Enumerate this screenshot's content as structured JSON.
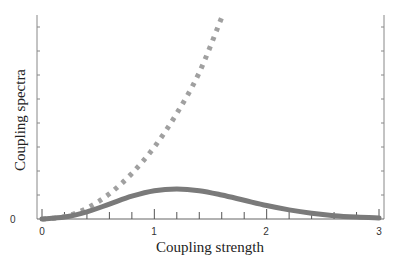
{
  "chart_data": {
    "type": "line",
    "title": "",
    "xlabel": "Coupling strength",
    "ylabel": "Coupling spectra",
    "xlim": [
      0,
      3
    ],
    "ylim": [
      0,
      8.5
    ],
    "x_ticks": [
      "0",
      "1",
      "2",
      "3"
    ],
    "y_ticks": [
      "0"
    ],
    "grid": false,
    "legend": null,
    "series": [
      {
        "name": "dotted",
        "style": "dotted",
        "color": "#a0a0a0",
        "x": [
          0,
          0.2,
          0.4,
          0.6,
          0.8,
          1.0,
          1.2,
          1.4,
          1.6
        ],
        "y": [
          0,
          0.1,
          0.45,
          1.05,
          1.9,
          3.0,
          4.4,
          6.1,
          8.4
        ]
      },
      {
        "name": "solid",
        "style": "solid",
        "color": "#7a7a7a",
        "x": [
          0,
          0.2,
          0.4,
          0.6,
          0.8,
          1.0,
          1.2,
          1.4,
          1.6,
          1.8,
          2.0,
          2.2,
          2.4,
          2.6,
          2.8,
          3.0
        ],
        "y": [
          0,
          0.08,
          0.3,
          0.62,
          0.95,
          1.18,
          1.25,
          1.18,
          1.0,
          0.78,
          0.56,
          0.38,
          0.24,
          0.14,
          0.08,
          0.04
        ]
      }
    ]
  }
}
